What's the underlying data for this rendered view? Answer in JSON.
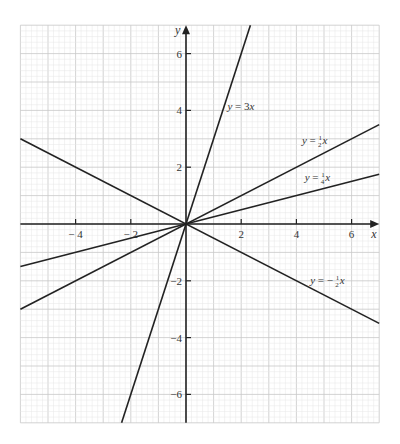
{
  "chart_data": {
    "type": "line",
    "title": "",
    "xlabel": "x",
    "ylabel": "y",
    "xlim": [
      -6,
      7
    ],
    "ylim": [
      -7,
      7
    ],
    "grid": true,
    "grid_minor_subdivisions": 5,
    "x_ticks": [
      -4,
      -2,
      2,
      4,
      6
    ],
    "y_ticks": [
      -6,
      -4,
      -2,
      2,
      4,
      6
    ],
    "x_tick_labels": [
      "− 4",
      "− 2",
      "2",
      "4",
      "6"
    ],
    "y_tick_labels": [
      "−6",
      "−4",
      "−2",
      "2",
      "4",
      "6"
    ],
    "series": [
      {
        "name": "y = 3x",
        "slope": 3,
        "label_main": "y = 3",
        "label_var": "x",
        "label_at": [
          1.5,
          4.0
        ]
      },
      {
        "name": "y = 1/2 x",
        "slope": 0.5,
        "label_main": "y = ",
        "label_num": "1",
        "label_den": "2",
        "label_var": "x",
        "label_at": [
          4.2,
          2.8
        ]
      },
      {
        "name": "y = 1/4 x",
        "slope": 0.25,
        "label_main": "y = ",
        "label_num": "1",
        "label_den": "4",
        "label_var": "x",
        "label_at": [
          4.3,
          1.5
        ]
      },
      {
        "name": "y = -1/2 x",
        "slope": -0.5,
        "label_main": "y = − ",
        "label_num": "1",
        "label_den": "2",
        "label_var": "x",
        "label_at": [
          4.5,
          -2.1
        ]
      }
    ],
    "colors": {
      "line": "#222222",
      "axis": "#222222",
      "grid_major": "#c8c8c8",
      "grid_minor": "#e6e6e6"
    }
  }
}
